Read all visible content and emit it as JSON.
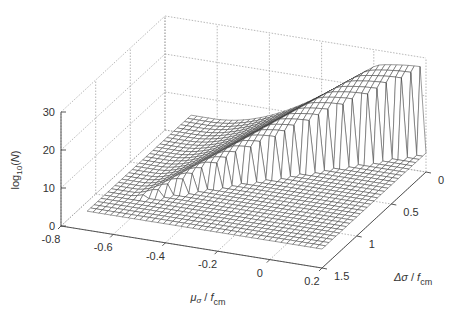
{
  "chart_data": {
    "type": "surface",
    "title": "",
    "xlabel": "μσ / fcm",
    "ylabel": "Δσ / fcm",
    "zlabel": "log10(N)",
    "xlim": [
      -0.8,
      0.2
    ],
    "ylim": [
      0,
      1.5
    ],
    "zlim": [
      0,
      30
    ],
    "x_ticks": [
      "-0.8",
      "-0.6",
      "-0.4",
      "-0.2",
      "0",
      "0.2"
    ],
    "y_ticks": [
      "0",
      "0.5",
      "1",
      "1.5"
    ],
    "z_ticks": [
      "0",
      "10",
      "20",
      "30"
    ],
    "grid": true,
    "style": "mesh wireframe, white faces, black edges",
    "surface_description": "log10(N) is ~5 (flat plateau) over most of the domain; rises steeply along a diagonal ridge where mu + delta/2 stays below ~0.25, peaking near 27-28 at mu ≈ 0.1..0.2, delta ≈ 0 and falling back to the plateau across the cliff",
    "surface_domain": {
      "mu_range": [
        -0.7,
        0.2
      ],
      "delta_range": [
        0,
        1.5
      ],
      "mu_steps": 40,
      "delta_steps": 30,
      "plateau": 5,
      "peak": 27.5
    }
  },
  "labels": {
    "z_axis": {
      "base": "log",
      "sub": "10",
      "rest": "(",
      "var": "N",
      "close": ")"
    },
    "x_axis": {
      "mu": "μ",
      "sub": "σ",
      "sep": " / ",
      "f": "f",
      "fsub": "cm"
    },
    "y_axis": {
      "delta": "Δσ",
      "sep": " / ",
      "f": "f",
      "fsub": "cm"
    }
  }
}
